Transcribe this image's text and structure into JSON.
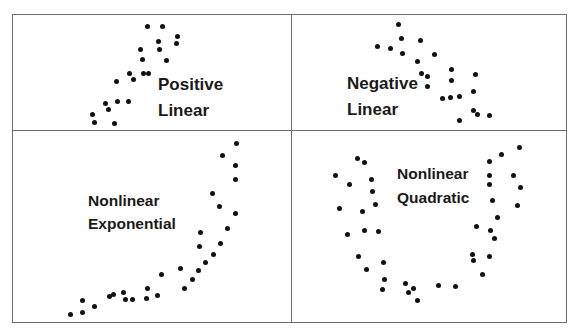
{
  "chart_data": [
    {
      "type": "scatter",
      "title": "Positive Linear",
      "label_lines": [
        "Positive",
        "Linear"
      ],
      "xlabel": "",
      "ylabel": "",
      "grid": false,
      "axes_visible": false,
      "points_px": [
        [
          147,
          26
        ],
        [
          162,
          26
        ],
        [
          177,
          36
        ],
        [
          176,
          43
        ],
        [
          158,
          41
        ],
        [
          159,
          49
        ],
        [
          140,
          49
        ],
        [
          142,
          59
        ],
        [
          166,
          60
        ],
        [
          129,
          73
        ],
        [
          143,
          73
        ],
        [
          148,
          73
        ],
        [
          133,
          79
        ],
        [
          116,
          81
        ],
        [
          105,
          103
        ],
        [
          117,
          101
        ],
        [
          128,
          101
        ],
        [
          108,
          109
        ],
        [
          92,
          114
        ],
        [
          94,
          122
        ],
        [
          114,
          123
        ]
      ]
    },
    {
      "type": "scatter",
      "title": "Negative Linear",
      "label_lines": [
        "Negative",
        "Linear"
      ],
      "xlabel": "",
      "ylabel": "",
      "grid": false,
      "axes_visible": false,
      "points_px": [
        [
          398,
          24
        ],
        [
          401,
          38
        ],
        [
          420,
          40
        ],
        [
          377,
          46
        ],
        [
          390,
          48
        ],
        [
          402,
          53
        ],
        [
          434,
          54
        ],
        [
          417,
          61
        ],
        [
          451,
          69
        ],
        [
          421,
          73
        ],
        [
          427,
          76
        ],
        [
          451,
          80
        ],
        [
          475,
          74
        ],
        [
          427,
          86
        ],
        [
          473,
          91
        ],
        [
          442,
          98
        ],
        [
          450,
          97
        ],
        [
          459,
          96
        ],
        [
          473,
          110
        ],
        [
          477,
          114
        ],
        [
          489,
          115
        ],
        [
          459,
          120
        ]
      ]
    },
    {
      "type": "scatter",
      "title": "Nonlinear Exponential",
      "label_lines": [
        "Nonlinear",
        "Exponential"
      ],
      "xlabel": "",
      "ylabel": "",
      "grid": false,
      "axes_visible": false,
      "points_px": [
        [
          70,
          314
        ],
        [
          82,
          312
        ],
        [
          82,
          300
        ],
        [
          94,
          306
        ],
        [
          109,
          296
        ],
        [
          113,
          294
        ],
        [
          123,
          292
        ],
        [
          125,
          299
        ],
        [
          132,
          299
        ],
        [
          146,
          298
        ],
        [
          147,
          288
        ],
        [
          157,
          295
        ],
        [
          161,
          274
        ],
        [
          180,
          268
        ],
        [
          184,
          288
        ],
        [
          192,
          279
        ],
        [
          198,
          270
        ],
        [
          205,
          262
        ],
        [
          213,
          254
        ],
        [
          220,
          243
        ],
        [
          199,
          246
        ],
        [
          200,
          232
        ],
        [
          227,
          228
        ],
        [
          219,
          206
        ],
        [
          212,
          193
        ],
        [
          235,
          213
        ],
        [
          235,
          179
        ],
        [
          235,
          165
        ],
        [
          222,
          155
        ],
        [
          236,
          143
        ]
      ]
    },
    {
      "type": "scatter",
      "title": "Nonlinear Quadratic",
      "label_lines": [
        "Nonlinear",
        "Quadratic"
      ],
      "xlabel": "",
      "ylabel": "",
      "grid": false,
      "axes_visible": false,
      "points_px": [
        [
          357,
          158
        ],
        [
          364,
          162
        ],
        [
          335,
          175
        ],
        [
          371,
          179
        ],
        [
          349,
          184
        ],
        [
          372,
          191
        ],
        [
          339,
          208
        ],
        [
          362,
          211
        ],
        [
          375,
          204
        ],
        [
          347,
          234
        ],
        [
          364,
          230
        ],
        [
          378,
          231
        ],
        [
          358,
          256
        ],
        [
          383,
          262
        ],
        [
          366,
          269
        ],
        [
          384,
          279
        ],
        [
          382,
          289
        ],
        [
          405,
          283
        ],
        [
          413,
          288
        ],
        [
          408,
          292
        ],
        [
          417,
          300
        ],
        [
          438,
          285
        ],
        [
          455,
          286
        ],
        [
          482,
          274
        ],
        [
          472,
          254
        ],
        [
          473,
          260
        ],
        [
          489,
          256
        ],
        [
          476,
          226
        ],
        [
          490,
          230
        ],
        [
          494,
          238
        ],
        [
          497,
          217
        ],
        [
          492,
          200
        ],
        [
          517,
          205
        ],
        [
          489,
          184
        ],
        [
          520,
          187
        ],
        [
          489,
          175
        ],
        [
          513,
          175
        ],
        [
          489,
          161
        ],
        [
          501,
          154
        ],
        [
          519,
          147
        ]
      ]
    }
  ],
  "panels": [
    {
      "name": "positive-linear",
      "label1": "Positive",
      "label2": "Linear"
    },
    {
      "name": "negative-linear",
      "label1": "Negative",
      "label2": "Linear"
    },
    {
      "name": "nonlinear-exponential",
      "label1": "Nonlinear",
      "label2": "Exponential"
    },
    {
      "name": "nonlinear-quadratic",
      "label1": "Nonlinear",
      "label2": "Quadratic"
    }
  ],
  "colors": {
    "dot": "#111111",
    "border": "#6e6e6e",
    "text": "#1a1a1a",
    "background": "#ffffff"
  }
}
